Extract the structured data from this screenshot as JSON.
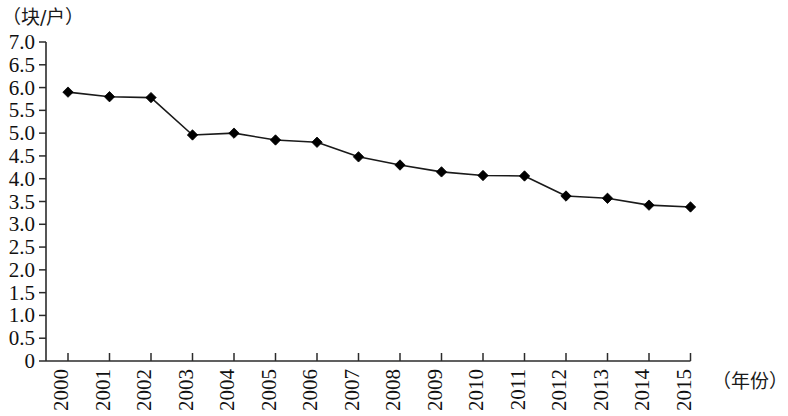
{
  "chart_data": {
    "type": "line",
    "title": "",
    "subtitle": "",
    "xlabel": "（年份）",
    "ylabel": "（块/户）",
    "categories": [
      "2000",
      "2001",
      "2002",
      "2003",
      "2004",
      "2005",
      "2006",
      "2007",
      "2008",
      "2009",
      "2010",
      "2011",
      "2012",
      "2013",
      "2014",
      "2015"
    ],
    "values": [
      5.9,
      5.8,
      5.78,
      4.96,
      5.0,
      4.85,
      4.8,
      4.48,
      4.3,
      4.15,
      4.07,
      4.06,
      3.62,
      3.57,
      3.42,
      3.38
    ],
    "series": [
      {
        "name": "块/户",
        "values": [
          5.9,
          5.8,
          5.78,
          4.96,
          5.0,
          4.85,
          4.8,
          4.48,
          4.3,
          4.15,
          4.07,
          4.06,
          3.62,
          3.57,
          3.42,
          3.38
        ]
      }
    ],
    "ylim": [
      0,
      7.0
    ],
    "ytick_labels": [
      "7.0",
      "6.5",
      "6.0",
      "5.5",
      "5.0",
      "4.5",
      "4.0",
      "3.5",
      "3.0",
      "2.5",
      "2.0",
      "1.5",
      "1.0",
      "0.5",
      "0"
    ],
    "ytick_values": [
      7.0,
      6.5,
      6.0,
      5.5,
      5.0,
      4.5,
      4.0,
      3.5,
      3.0,
      2.5,
      2.0,
      1.5,
      1.0,
      0.5,
      0
    ],
    "ystep": 0.5,
    "grid": false,
    "legend": false,
    "legend_position": "none",
    "marker": "diamond",
    "line_color": "#1a1a1a",
    "marker_color": "#000000",
    "axis_color": "#2b2b2b",
    "xtick_label_rotation": -90,
    "annotations": []
  }
}
